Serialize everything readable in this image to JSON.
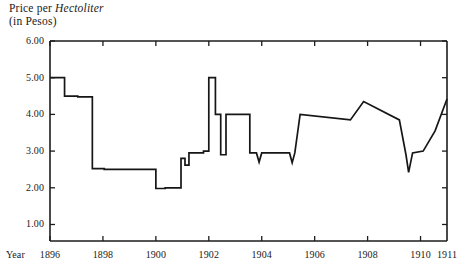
{
  "title": {
    "line1_pre": "Price per ",
    "line1_em": "Hectoliter",
    "line2": "(in Pesos)"
  },
  "axes": {
    "year_caption": "Year",
    "y_ticks": [
      "6.00",
      "5.00",
      "4.00",
      "3.00",
      "2.00",
      "1.00"
    ],
    "x_ticks": [
      "1896",
      "1898",
      "1900",
      "1902",
      "1904",
      "1906",
      "1908",
      "1910",
      "1911"
    ]
  },
  "style": {
    "line_color": "#161616",
    "axis_color": "#1c1c1c",
    "background": "#ffffff"
  },
  "chart_data": {
    "type": "line",
    "title": "Price per Hectoliter (in Pesos)",
    "xlabel": "Year",
    "ylabel": "Price per Hectoliter (in Pesos)",
    "xlim": [
      1896.0,
      1911.0
    ],
    "ylim": [
      0.55,
      6.0
    ],
    "grid": false,
    "legend": null,
    "y_tick_values": [
      6.0,
      5.0,
      4.0,
      3.0,
      2.0,
      1.0
    ],
    "x_tick_values": [
      1896,
      1898,
      1900,
      1902,
      1904,
      1906,
      1908,
      1910,
      1911
    ],
    "series": [
      {
        "name": "Price per Hectoliter",
        "step_like": true,
        "x": [
          1896.0,
          1896.55,
          1896.55,
          1897.05,
          1897.05,
          1897.6,
          1897.6,
          1898.05,
          1898.05,
          1900.0,
          1900.0,
          1900.35,
          1900.35,
          1900.95,
          1900.95,
          1901.1,
          1901.1,
          1901.25,
          1901.25,
          1901.8,
          1901.8,
          1902.0,
          1902.0,
          1902.25,
          1902.25,
          1902.45,
          1902.45,
          1902.65,
          1902.65,
          1903.55,
          1903.55,
          1903.8,
          1903.9,
          1904.0,
          1904.0,
          1905.05,
          1905.15,
          1905.25,
          1905.25,
          1905.45,
          1905.45,
          1907.35,
          1907.35,
          1907.85,
          1907.85,
          1909.2,
          1909.2,
          1909.45,
          1909.55,
          1909.7,
          1909.7,
          1910.1,
          1910.1,
          1910.55,
          1910.55,
          1911.0
        ],
        "y": [
          5.0,
          5.0,
          4.5,
          4.5,
          4.48,
          4.48,
          2.52,
          2.52,
          2.5,
          2.5,
          1.98,
          1.98,
          2.0,
          2.0,
          2.8,
          2.8,
          2.62,
          2.62,
          2.95,
          2.95,
          3.0,
          3.0,
          5.0,
          5.0,
          4.0,
          4.0,
          2.9,
          2.9,
          4.0,
          4.0,
          2.95,
          2.95,
          2.7,
          2.95,
          2.95,
          2.95,
          2.68,
          2.95,
          2.95,
          4.0,
          4.0,
          3.85,
          3.85,
          4.35,
          4.35,
          3.85,
          3.85,
          2.9,
          2.42,
          2.95,
          2.95,
          3.0,
          3.0,
          3.55,
          3.55,
          4.42
        ],
        "annotations": [
          {
            "note": "opening plateau at 5.00 pesos, 1896"
          },
          {
            "note": "step down to ~4.50 in 1897"
          },
          {
            "note": "sharp fall to ~2.50 by late 1897"
          },
          {
            "note": "trough near 2.00 through 1898-1900"
          },
          {
            "note": "spike to 5.00 in early 1902"
          },
          {
            "note": "narrow downward notches near 2.70 during 1904-1905"
          },
          {
            "note": "deep dip to ~2.42 in 1909"
          },
          {
            "note": "recovery to ~4.42 by 1911"
          }
        ]
      }
    ]
  },
  "plot_geometry": {
    "left_px": 50,
    "right_px": 447,
    "top_px": 41,
    "bottom_px": 241,
    "y_value_at_top_px": 6.0,
    "y_value_at_bottom_px": 0.55
  }
}
